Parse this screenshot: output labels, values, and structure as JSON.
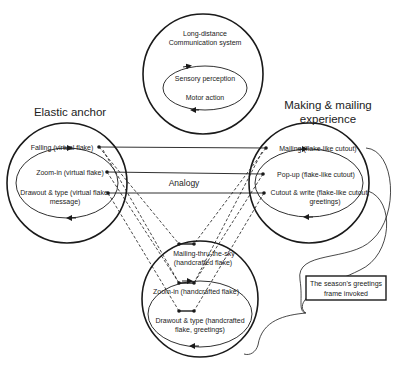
{
  "top_circle": {
    "title_line1": "Long-distance",
    "title_line2": "Communication system",
    "loop_top": "Sensory perception",
    "loop_bottom": "Motor action"
  },
  "left_circle": {
    "heading": "Elastic anchor",
    "items": [
      "Falling (virtual flake)",
      "Zoom-in (virtual flake)",
      "Drawout & type (virtual flake,",
      "message)"
    ]
  },
  "right_circle": {
    "heading_line1": "Making & mailing",
    "heading_line2": "experience",
    "items": [
      "Mailing (flake-like cutout)",
      "Pop-up (flake-like cutout)",
      "Cutout & write (flake-like cutout,",
      "greetings)"
    ]
  },
  "bottom_circle": {
    "items": [
      "Mailing-thru-the-sky",
      "(handcrafted flake)",
      "Zoom-in (handcrafted flake)",
      "Drawout & type (handcrafted",
      "flake, greetings)"
    ]
  },
  "center_label": "Analogy",
  "callout": {
    "line1": "The season's greetings",
    "line2": "frame invoked"
  },
  "colors": {
    "stroke": "#1a1a1a",
    "text": "#222222",
    "background": "#ffffff"
  }
}
